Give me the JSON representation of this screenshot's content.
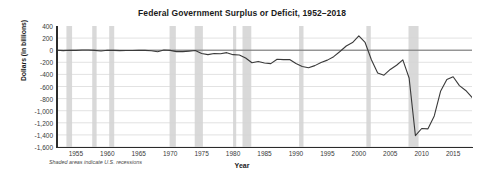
{
  "chart_data": {
    "type": "line",
    "title": "Federal Government Surplus or Deficit, 1952–2018",
    "xlabel": "Year",
    "ylabel": "Dollars (in billions)",
    "footnote": "Shaded areas indicate U.S. recessions",
    "xlim": [
      1952,
      2018
    ],
    "ylim": [
      -1600,
      400
    ],
    "ytick_values": [
      400,
      200,
      0,
      -200,
      -400,
      -600,
      -800,
      -1000,
      -1200,
      -1400,
      -1600
    ],
    "ytick_labels": [
      "400",
      "200",
      "0",
      "-200",
      "-400",
      "-600",
      "-800",
      "-1,000",
      "-1,200",
      "-1,400",
      "-1,600"
    ],
    "xtick_values": [
      1955,
      1960,
      1965,
      1970,
      1975,
      1980,
      1985,
      1990,
      1995,
      2000,
      2005,
      2010,
      2015
    ],
    "xtick_labels": [
      "1955",
      "1960",
      "1965",
      "1970",
      "1975",
      "1980",
      "1985",
      "1990",
      "1995",
      "2000",
      "2005",
      "2010",
      "2015"
    ],
    "grid": "horizontal",
    "legend": "none",
    "line_color": "#3a3a3a",
    "recession_color": "#d9d9d9",
    "zero_line": 0,
    "series": [
      {
        "name": "Federal Surplus or Deficit",
        "x": [
          1952,
          1953,
          1954,
          1955,
          1956,
          1957,
          1958,
          1959,
          1960,
          1961,
          1962,
          1963,
          1964,
          1965,
          1966,
          1967,
          1968,
          1969,
          1970,
          1971,
          1972,
          1973,
          1974,
          1975,
          1976,
          1977,
          1978,
          1979,
          1980,
          1981,
          1982,
          1983,
          1984,
          1985,
          1986,
          1987,
          1988,
          1989,
          1990,
          1991,
          1992,
          1993,
          1994,
          1995,
          1996,
          1997,
          1998,
          1999,
          2000,
          2001,
          2002,
          2003,
          2004,
          2005,
          2006,
          2007,
          2008,
          2009,
          2010,
          2011,
          2012,
          2013,
          2014,
          2015,
          2016,
          2017,
          2018
        ],
        "y": [
          -1.5,
          -6.5,
          -1.2,
          -3.0,
          3.9,
          3.4,
          -2.8,
          -12.8,
          0.3,
          -3.3,
          -7.1,
          -4.8,
          -5.9,
          -1.4,
          -3.7,
          -8.6,
          -25.2,
          3.2,
          -2.8,
          -23.0,
          -23.4,
          -14.9,
          -6.1,
          -53.2,
          -73.7,
          -53.7,
          -59.2,
          -40.7,
          -73.8,
          -79.0,
          -128.0,
          -207.8,
          -185.4,
          -212.3,
          -221.2,
          -149.7,
          -155.2,
          -152.6,
          -221.0,
          -269.2,
          -290.3,
          -255.1,
          -203.2,
          -164.0,
          -107.4,
          -21.9,
          69.3,
          125.6,
          236.2,
          128.2,
          -157.8,
          -377.6,
          -412.7,
          -318.3,
          -248.2,
          -160.7,
          -458.6,
          -1412.7,
          -1294.4,
          -1299.6,
          -1087.0,
          -679.5,
          -484.8,
          -438.4,
          -584.7,
          -665.4,
          -779.0
        ]
      }
    ],
    "recessions": [
      {
        "start": 1953.5,
        "end": 1954.4
      },
      {
        "start": 1957.6,
        "end": 1958.3
      },
      {
        "start": 1960.3,
        "end": 1961.1
      },
      {
        "start": 1969.9,
        "end": 1970.9
      },
      {
        "start": 1973.9,
        "end": 1975.2
      },
      {
        "start": 1980.0,
        "end": 1980.5
      },
      {
        "start": 1981.5,
        "end": 1982.9
      },
      {
        "start": 1990.5,
        "end": 1991.2
      },
      {
        "start": 2001.2,
        "end": 2001.9
      },
      {
        "start": 2007.9,
        "end": 2009.5
      }
    ]
  }
}
